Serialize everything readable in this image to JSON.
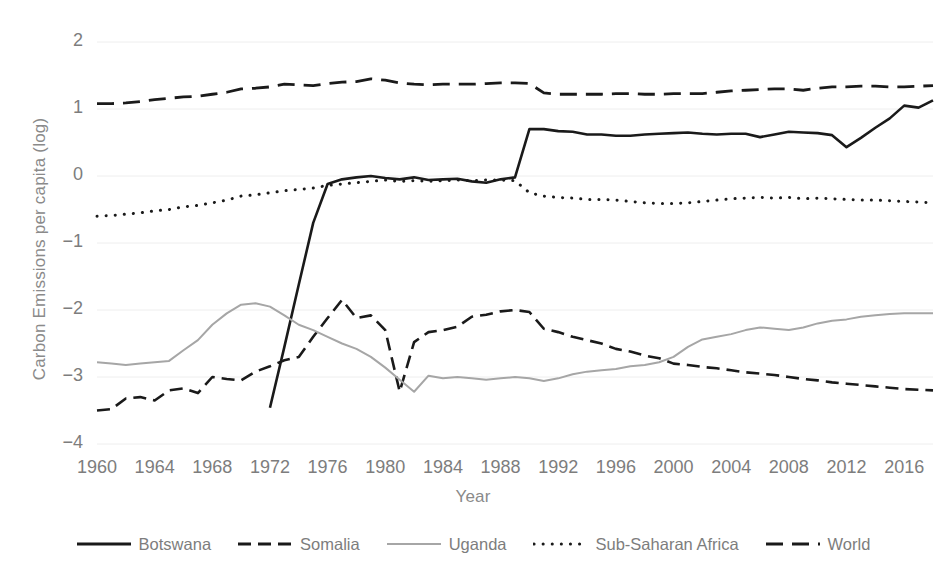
{
  "chart_data": {
    "type": "line",
    "title": "",
    "xlabel": "Year",
    "ylabel": "Carbon Emissions per capita (log)",
    "xlim": [
      1960,
      2018
    ],
    "ylim": [
      -4,
      2
    ],
    "yticks": [
      "2",
      "1",
      "0",
      "−1",
      "−2",
      "−3",
      "−4"
    ],
    "ytick_values": [
      2,
      1,
      0,
      -1,
      -2,
      -3,
      -4
    ],
    "xticks": [
      "1960",
      "1964",
      "1968",
      "1972",
      "1976",
      "1980",
      "1984",
      "1988",
      "1992",
      "1996",
      "2000",
      "2004",
      "2008",
      "2012",
      "2016"
    ],
    "xtick_values": [
      1960,
      1964,
      1968,
      1972,
      1976,
      1980,
      1984,
      1988,
      1992,
      1996,
      2000,
      2004,
      2008,
      2012,
      2016
    ],
    "grid": true,
    "grid_axis": "y",
    "legend_position": "bottom",
    "x": [
      1960,
      1961,
      1962,
      1963,
      1964,
      1965,
      1966,
      1967,
      1968,
      1969,
      1970,
      1971,
      1972,
      1973,
      1974,
      1975,
      1976,
      1977,
      1978,
      1979,
      1980,
      1981,
      1982,
      1983,
      1984,
      1985,
      1986,
      1987,
      1988,
      1989,
      1990,
      1991,
      1992,
      1993,
      1994,
      1995,
      1996,
      1997,
      1998,
      1999,
      2000,
      2001,
      2002,
      2003,
      2004,
      2005,
      2006,
      2007,
      2008,
      2009,
      2010,
      2011,
      2012,
      2013,
      2014,
      2015,
      2016,
      2017,
      2018
    ],
    "series": [
      {
        "name": "Botswana",
        "style": "solid",
        "color": "#1a1a1a",
        "width": 2.6,
        "values": [
          null,
          null,
          null,
          null,
          null,
          null,
          null,
          null,
          null,
          null,
          null,
          null,
          -3.46,
          -2.55,
          -1.62,
          -0.7,
          -0.12,
          -0.05,
          -0.02,
          0.0,
          -0.03,
          -0.05,
          -0.02,
          -0.06,
          -0.05,
          -0.04,
          -0.08,
          -0.1,
          -0.05,
          -0.02,
          0.7,
          0.7,
          0.67,
          0.66,
          0.62,
          0.62,
          0.6,
          0.6,
          0.62,
          0.63,
          0.64,
          0.65,
          0.63,
          0.62,
          0.63,
          0.63,
          0.58,
          0.62,
          0.66,
          0.65,
          0.64,
          0.61,
          0.43,
          0.57,
          0.72,
          0.86,
          1.05,
          1.02,
          1.13
        ]
      },
      {
        "name": "Somalia",
        "style": "dashed",
        "color": "#1a1a1a",
        "width": 2.6,
        "values": [
          -3.5,
          -3.48,
          -3.32,
          -3.3,
          -3.35,
          -3.2,
          -3.17,
          -3.24,
          -3.0,
          -3.03,
          -3.05,
          -2.92,
          -2.84,
          -2.75,
          -2.7,
          -2.4,
          -2.12,
          -1.85,
          -2.12,
          -2.08,
          -2.3,
          -3.22,
          -2.48,
          -2.33,
          -2.3,
          -2.25,
          -2.1,
          -2.07,
          -2.02,
          -2.0,
          -2.03,
          -2.28,
          -2.33,
          -2.4,
          -2.45,
          -2.5,
          -2.58,
          -2.62,
          -2.68,
          -2.72,
          -2.8,
          -2.82,
          -2.85,
          -2.87,
          -2.9,
          -2.93,
          -2.95,
          -2.97,
          -3.0,
          -3.03,
          -3.05,
          -3.08,
          -3.1,
          -3.12,
          -3.14,
          -3.16,
          -3.18,
          -3.19,
          -3.2
        ]
      },
      {
        "name": "Uganda",
        "style": "solid-light",
        "color": "#a6a6a6",
        "width": 2.0,
        "values": [
          -2.78,
          -2.8,
          -2.82,
          -2.8,
          -2.78,
          -2.76,
          -2.6,
          -2.45,
          -2.22,
          -2.05,
          -1.92,
          -1.9,
          -1.95,
          -2.08,
          -2.22,
          -2.3,
          -2.4,
          -2.5,
          -2.58,
          -2.7,
          -2.86,
          -3.04,
          -3.22,
          -2.98,
          -3.02,
          -3.0,
          -3.02,
          -3.04,
          -3.02,
          -3.0,
          -3.02,
          -3.06,
          -3.02,
          -2.96,
          -2.92,
          -2.9,
          -2.88,
          -2.84,
          -2.82,
          -2.78,
          -2.7,
          -2.55,
          -2.44,
          -2.4,
          -2.36,
          -2.3,
          -2.26,
          -2.28,
          -2.3,
          -2.26,
          -2.2,
          -2.16,
          -2.14,
          -2.1,
          -2.08,
          -2.06,
          -2.05,
          -2.05,
          -2.05
        ]
      },
      {
        "name": "Sub-Saharan Africa",
        "style": "dotted",
        "color": "#1a1a1a",
        "width": 3.0,
        "values": [
          -0.6,
          -0.59,
          -0.57,
          -0.55,
          -0.52,
          -0.5,
          -0.46,
          -0.44,
          -0.4,
          -0.36,
          -0.3,
          -0.28,
          -0.25,
          -0.22,
          -0.2,
          -0.18,
          -0.14,
          -0.12,
          -0.1,
          -0.08,
          -0.06,
          -0.08,
          -0.07,
          -0.08,
          -0.07,
          -0.06,
          -0.07,
          -0.06,
          -0.06,
          -0.07,
          -0.25,
          -0.3,
          -0.32,
          -0.33,
          -0.35,
          -0.35,
          -0.36,
          -0.38,
          -0.4,
          -0.41,
          -0.41,
          -0.4,
          -0.38,
          -0.36,
          -0.34,
          -0.33,
          -0.32,
          -0.33,
          -0.32,
          -0.34,
          -0.33,
          -0.34,
          -0.35,
          -0.36,
          -0.36,
          -0.37,
          -0.38,
          -0.39,
          -0.4
        ]
      },
      {
        "name": "World",
        "style": "dash-long",
        "color": "#1a1a1a",
        "width": 2.8,
        "values": [
          1.08,
          1.08,
          1.09,
          1.11,
          1.14,
          1.16,
          1.18,
          1.19,
          1.22,
          1.25,
          1.3,
          1.31,
          1.33,
          1.37,
          1.36,
          1.35,
          1.38,
          1.4,
          1.41,
          1.45,
          1.43,
          1.39,
          1.37,
          1.36,
          1.37,
          1.37,
          1.37,
          1.38,
          1.39,
          1.39,
          1.38,
          1.24,
          1.22,
          1.22,
          1.22,
          1.22,
          1.23,
          1.23,
          1.22,
          1.22,
          1.23,
          1.23,
          1.23,
          1.25,
          1.27,
          1.28,
          1.29,
          1.3,
          1.3,
          1.28,
          1.31,
          1.33,
          1.33,
          1.34,
          1.34,
          1.33,
          1.33,
          1.34,
          1.35
        ]
      }
    ]
  },
  "legend": {
    "items": [
      {
        "label": "Botswana",
        "style": "solid",
        "color": "#1a1a1a"
      },
      {
        "label": "Somalia",
        "style": "dashed",
        "color": "#1a1a1a"
      },
      {
        "label": "Uganda",
        "style": "solid-light",
        "color": "#a6a6a6"
      },
      {
        "label": "Sub-Saharan Africa",
        "style": "dotted",
        "color": "#1a1a1a"
      },
      {
        "label": "World",
        "style": "dash-long",
        "color": "#1a1a1a"
      }
    ]
  },
  "colors": {
    "grid": "#eeeeee",
    "tick_text": "#7d7d7d",
    "axis_text": "#8a8a8a",
    "background": "#ffffff"
  }
}
